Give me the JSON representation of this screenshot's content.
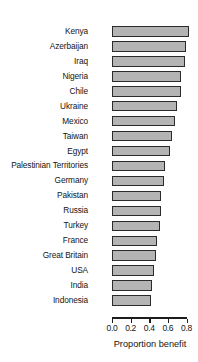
{
  "chart_data": {
    "type": "bar",
    "orientation": "horizontal",
    "title": "",
    "subtitle": "",
    "xlabel": "Proportion benefit",
    "ylabel": "",
    "xlim": [
      0.0,
      0.85
    ],
    "axis_min": 0.0,
    "axis_max": 0.8,
    "grid": false,
    "legend": null,
    "bar_fill_color": "#b4b4b4",
    "bar_border_color": "#2b2b2b",
    "tick_labels": [
      "0.0",
      "0.2",
      "0.4",
      "0.6",
      "0.8"
    ],
    "tick_values": [
      0.0,
      0.2,
      0.4,
      0.6,
      0.8
    ],
    "categories": [
      "Kenya",
      "Azerbaijan",
      "Iraq",
      "Nigeria",
      "Chile",
      "Ukraine",
      "Mexico",
      "Taiwan",
      "Egypt",
      "Palestinian Territories",
      "Germany",
      "Pakistan",
      "Russia",
      "Turkey",
      "France",
      "Great Britain",
      "USA",
      "India",
      "Indonesia"
    ],
    "values": [
      0.8,
      0.77,
      0.76,
      0.72,
      0.72,
      0.68,
      0.66,
      0.62,
      0.6,
      0.55,
      0.54,
      0.5,
      0.5,
      0.49,
      0.46,
      0.45,
      0.43,
      0.41,
      0.4
    ],
    "bars": [
      {
        "category": "Kenya",
        "value": 0.8
      },
      {
        "category": "Azerbaijan",
        "value": 0.77
      },
      {
        "category": "Iraq",
        "value": 0.76
      },
      {
        "category": "Nigeria",
        "value": 0.72
      },
      {
        "category": "Chile",
        "value": 0.72
      },
      {
        "category": "Ukraine",
        "value": 0.68
      },
      {
        "category": "Mexico",
        "value": 0.66
      },
      {
        "category": "Taiwan",
        "value": 0.62
      },
      {
        "category": "Egypt",
        "value": 0.6
      },
      {
        "category": "Palestinian Territories",
        "value": 0.55
      },
      {
        "category": "Germany",
        "value": 0.54
      },
      {
        "category": "Pakistan",
        "value": 0.5
      },
      {
        "category": "Russia",
        "value": 0.5
      },
      {
        "category": "Turkey",
        "value": 0.49
      },
      {
        "category": "France",
        "value": 0.46
      },
      {
        "category": "Great Britain",
        "value": 0.45
      },
      {
        "category": "USA",
        "value": 0.43
      },
      {
        "category": "India",
        "value": 0.41
      },
      {
        "category": "Indonesia",
        "value": 0.4
      }
    ]
  }
}
